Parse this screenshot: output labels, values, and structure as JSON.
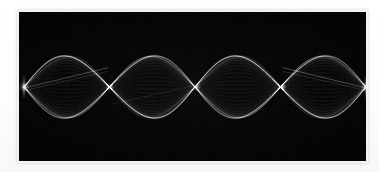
{
  "figure": {
    "kind": "standing-wave-photograph",
    "caption": "",
    "background_color": "#ffffff",
    "plate": {
      "x": 19,
      "y": 12,
      "width": 347,
      "height": 149,
      "background_color": "#030303",
      "border_color": "#f2f2f2"
    }
  },
  "chart_data": {
    "type": "line",
    "title": "",
    "subtitle": "",
    "xlabel": "",
    "ylabel": "",
    "grid": false,
    "legend": null,
    "annotations": [],
    "harmonic": 4,
    "loops": 4,
    "stroke_color": "#ffffff",
    "x": [
      0,
      0.0625,
      0.125,
      0.1875,
      0.25,
      0.3125,
      0.375,
      0.4375,
      0.5,
      0.5625,
      0.625,
      0.6875,
      0.75,
      0.8125,
      0.875,
      0.9375,
      1.0
    ],
    "xlim": [
      0,
      1
    ],
    "ylim": [
      -1,
      1
    ],
    "node_positions_norm": [
      0.0,
      0.25,
      0.5,
      0.75,
      1.0
    ],
    "node_positions_px": [
      24,
      110,
      197,
      283,
      366
    ],
    "antinode_positions_norm": [
      0.125,
      0.375,
      0.625,
      0.875
    ],
    "antinode_positions_px": [
      67,
      153,
      240,
      326
    ],
    "center_y_px": 87,
    "amplitude_px": 31,
    "series": [
      {
        "name": "envelope-upper",
        "values": [
          0,
          0.383,
          0.707,
          0.924,
          1.0,
          0.924,
          0.707,
          0.383,
          0,
          -0.383,
          -0.707,
          -0.924,
          -1.0,
          -0.924,
          -0.707,
          -0.383,
          0
        ]
      },
      {
        "name": "envelope-lower",
        "values": [
          0,
          -0.383,
          -0.707,
          -0.924,
          -1.0,
          -0.924,
          -0.707,
          -0.383,
          0,
          0.383,
          0.707,
          0.924,
          1.0,
          0.924,
          0.707,
          0.383,
          0
        ]
      },
      {
        "name": "instantaneous-traces",
        "values": [
          0,
          0.27,
          0.5,
          0.65,
          0.71,
          0.65,
          0.5,
          0.27,
          0,
          -0.27,
          -0.5,
          -0.65,
          -0.71,
          -0.65,
          -0.5,
          -0.27,
          0
        ]
      },
      {
        "name": "secondary-mode-chord",
        "values": [
          0,
          0.12,
          0.22,
          0.28,
          0.3,
          0.26,
          0.17,
          0.07,
          0,
          -0.07,
          -0.17,
          -0.26,
          -0.3,
          -0.28,
          -0.22,
          -0.12,
          0
        ]
      }
    ],
    "phase_samples": 46,
    "strand_count": 46
  }
}
